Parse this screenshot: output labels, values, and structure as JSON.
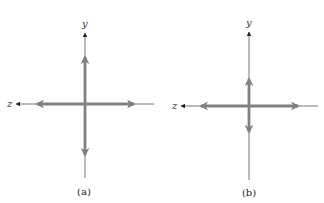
{
  "colors": {
    "axis": "#333333",
    "vector": "#808080",
    "background": "#ffffff"
  },
  "panels": [
    {
      "label": "(a)",
      "axes": {
        "vertical": "y",
        "horizontal": "z"
      },
      "description": "Long vertical double arrow and long horizontal double arrow"
    },
    {
      "label": "(b)",
      "axes": {
        "vertical": "y",
        "horizontal": "z"
      },
      "description": "Short vertical double arrow and long horizontal double arrow"
    }
  ]
}
